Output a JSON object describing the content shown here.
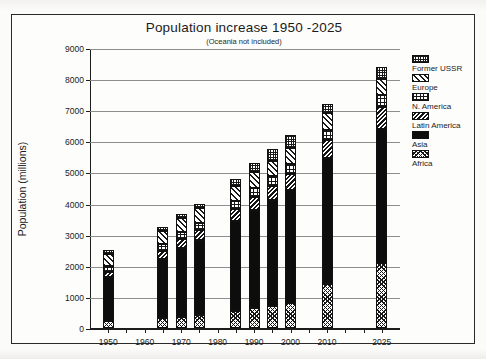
{
  "chart_data": {
    "type": "bar",
    "stacked": true,
    "title": "Population increase 1950 -2025",
    "subtitle": "(Oceania not included)",
    "xlabel": "",
    "ylabel": "Population (millions)",
    "ylim": [
      0,
      9000
    ],
    "ytick_step": 1000,
    "yticks": [
      0,
      1000,
      2000,
      3000,
      4000,
      5000,
      6000,
      7000,
      8000,
      9000
    ],
    "ytick_labels": [
      "0",
      "1000",
      "2000",
      "3000",
      "4000",
      "5000",
      "6000",
      "7000",
      "8000",
      "9000"
    ],
    "xlim": [
      1945,
      2030
    ],
    "xticks": [
      1950,
      1960,
      1970,
      1980,
      1990,
      2000,
      2010,
      2025
    ],
    "xtick_labels": [
      "1950",
      "1960",
      "1970",
      "1980",
      "1990",
      "2000",
      "2010",
      "2025"
    ],
    "grid": "horizontal",
    "legend_position": "right-outside",
    "categories": [
      1950,
      1965,
      1970,
      1975,
      1985,
      1990,
      1995,
      2000,
      2010,
      2025
    ],
    "category_labels": [
      "1950",
      "1965",
      "1970",
      "1975",
      "1985",
      "1990",
      "1995",
      "2000",
      "2010",
      "2025"
    ],
    "series": [
      {
        "name": "Africa",
        "pattern": "coarse-crosshatch-dots",
        "values": [
          225,
          320,
          370,
          420,
          555,
          630,
          720,
          810,
          1400,
          2100
        ]
      },
      {
        "name": "Asia",
        "pattern": "solid-black",
        "values": [
          1425,
          1900,
          2200,
          2400,
          2870,
          3150,
          3380,
          3630,
          4050,
          4300
        ]
      },
      {
        "name": "Latin America",
        "pattern": "dense-diagonal-hatch",
        "values": [
          165,
          250,
          280,
          320,
          400,
          440,
          480,
          520,
          590,
          700
        ]
      },
      {
        "name": "N. America",
        "pattern": "vertical-grid-lines",
        "values": [
          165,
          215,
          230,
          240,
          265,
          280,
          295,
          310,
          340,
          380
        ]
      },
      {
        "name": "Europe",
        "pattern": "light-diagonal-hatch",
        "values": [
          390,
          440,
          460,
          475,
          490,
          500,
          505,
          510,
          520,
          520
        ]
      },
      {
        "name": "Former USSR",
        "pattern": "fine-dot-grid",
        "values": [
          150,
          125,
          110,
          145,
          220,
          300,
          370,
          420,
          300,
          400
        ]
      }
    ],
    "totals": [
      2520,
      3250,
      3650,
      4000,
      4800,
      5300,
      5750,
      6200,
      7200,
      8400
    ]
  },
  "legend": {
    "entries": [
      {
        "label": "Former USSR",
        "pattern": "fine-dot-grid"
      },
      {
        "label": "Europe",
        "pattern": "light-diagonal-hatch"
      },
      {
        "label": "N. America",
        "pattern": "vertical-grid-lines"
      },
      {
        "label": "Latin America",
        "pattern": "dense-diagonal-hatch"
      },
      {
        "label": "Asia",
        "pattern": "solid-black"
      },
      {
        "label": "Africa",
        "pattern": "coarse-crosshatch-dots"
      }
    ]
  },
  "colors": {
    "ink": "#111111",
    "grid": "#8d8d8d",
    "paper": "#fdfdfc"
  }
}
